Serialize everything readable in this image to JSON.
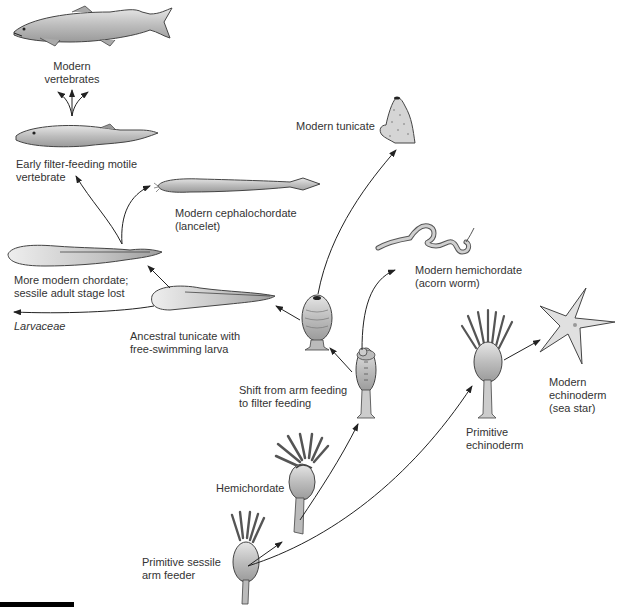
{
  "diagram": {
    "type": "evolutionary-phylogeny",
    "nodes": [
      {
        "id": "primitive-sessile-arm-feeder",
        "label": "Primitive sessile\narm feeder"
      },
      {
        "id": "hemichordate",
        "label": "Hemichordate"
      },
      {
        "id": "shift-arm-to-filter",
        "label": "Shift from arm feeding\nto filter feeding"
      },
      {
        "id": "primitive-echinoderm",
        "label": "Primitive\nechinoderm"
      },
      {
        "id": "modern-echinoderm",
        "label": "Modern\nechinoderm\n(sea star)"
      },
      {
        "id": "modern-hemichordate",
        "label": "Modern hemichordate\n(acorn worm)"
      },
      {
        "id": "sessile-tunicate",
        "label": ""
      },
      {
        "id": "modern-tunicate",
        "label": "Modern tunicate"
      },
      {
        "id": "ancestral-tunicate",
        "label": "Ancestral tunicate with\nfree-swimming larva"
      },
      {
        "id": "larvaceae",
        "label": "Larvaceae"
      },
      {
        "id": "more-modern-chordate",
        "label": "More modern chordate;\nsessile adult stage lost"
      },
      {
        "id": "modern-cephalochordate",
        "label": "Modern cephalochordate\n(lancelet)"
      },
      {
        "id": "early-vertebrate",
        "label": "Early filter-feeding motile\nvertebrate"
      },
      {
        "id": "modern-vertebrates",
        "label": "Modern\nvertebrates"
      }
    ],
    "edges": [
      {
        "from": "primitive-sessile-arm-feeder",
        "to": "hemichordate"
      },
      {
        "from": "primitive-sessile-arm-feeder",
        "to": "primitive-echinoderm"
      },
      {
        "from": "hemichordate",
        "to": "shift-arm-to-filter"
      },
      {
        "from": "primitive-echinoderm",
        "to": "modern-echinoderm"
      },
      {
        "from": "shift-arm-to-filter",
        "to": "modern-hemichordate"
      },
      {
        "from": "shift-arm-to-filter",
        "to": "sessile-tunicate"
      },
      {
        "from": "sessile-tunicate",
        "to": "modern-tunicate"
      },
      {
        "from": "sessile-tunicate",
        "to": "ancestral-tunicate"
      },
      {
        "from": "ancestral-tunicate",
        "to": "larvaceae"
      },
      {
        "from": "ancestral-tunicate",
        "to": "more-modern-chordate"
      },
      {
        "from": "more-modern-chordate",
        "to": "modern-cephalochordate"
      },
      {
        "from": "more-modern-chordate",
        "to": "early-vertebrate"
      },
      {
        "from": "early-vertebrate",
        "to": "modern-vertebrates"
      }
    ]
  },
  "labels": {
    "modern_vertebrates": "Modern\nvertebrates",
    "early_vertebrate": "Early filter-feeding motile\nvertebrate",
    "modern_cephalochordate": "Modern cephalochordate\n(lancelet)",
    "more_modern_chordate": "More modern chordate;\nsessile adult stage lost",
    "larvaceae": "Larvaceae",
    "ancestral_tunicate": "Ancestral tunicate with\nfree-swimming larva",
    "modern_tunicate": "Modern tunicate",
    "modern_hemichordate": "Modern hemichordate\n(acorn worm)",
    "shift_feeding": "Shift from arm feeding\nto filter feeding",
    "modern_echinoderm": "Modern\nechinoderm\n(sea star)",
    "primitive_echinoderm": "Primitive\nechinoderm",
    "hemichordate": "Hemichordate",
    "primitive_arm_feeder": "Primitive sessile\narm feeder"
  },
  "colors": {
    "ink": "#2a2a2a",
    "body_fill": "#c9c9c9",
    "body_light": "#e4e4e4",
    "arrow": "#222222"
  }
}
